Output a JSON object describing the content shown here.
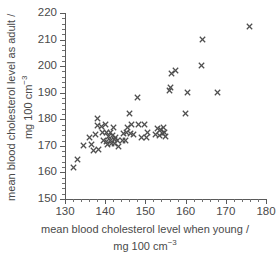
{
  "chart_data": {
    "type": "scatter",
    "title": "",
    "xlabel": "mean blood cholesterol level when young / mg 100 cm⁻³",
    "ylabel": "mean blood cholesterol level as adult / mg 100 cm⁻³",
    "xlabel_line1": "mean blood cholesterol level when young /",
    "xlabel_line2_prefix": "mg 100 cm",
    "xlabel_line2_sup": "−3",
    "ylabel_line1": "mean blood cholesterol level as adult /",
    "ylabel_line2_prefix": "mg 100 cm",
    "ylabel_line2_sup": "−3",
    "xlim": [
      130,
      180
    ],
    "ylim": [
      150,
      220
    ],
    "xticks": [
      130,
      140,
      150,
      160,
      170,
      180
    ],
    "yticks": [
      150,
      160,
      170,
      180,
      190,
      200,
      210,
      220
    ],
    "xtick_labels": [
      "130",
      "140",
      "150",
      "160",
      "170",
      "180"
    ],
    "ytick_labels": [
      "150",
      "160",
      "170",
      "180",
      "190",
      "200",
      "210",
      "220"
    ],
    "x_minor_step": 2,
    "y_minor_step": 2,
    "grid": false,
    "legend": false,
    "marker": "x",
    "marker_color": "#4f4f4f",
    "axis_color": "#5a5a5a",
    "background_color": "#ffffff",
    "points": [
      [
        132.0,
        162.0
      ],
      [
        133.2,
        165.0
      ],
      [
        134.6,
        170.3
      ],
      [
        136.2,
        173.0
      ],
      [
        136.6,
        170.5
      ],
      [
        137.0,
        168.2
      ],
      [
        137.6,
        174.2
      ],
      [
        138.0,
        180.3
      ],
      [
        138.2,
        177.8
      ],
      [
        138.4,
        168.5
      ],
      [
        139.0,
        177.2
      ],
      [
        139.4,
        175.2
      ],
      [
        139.6,
        172.0
      ],
      [
        140.0,
        178.0
      ],
      [
        140.2,
        175.0
      ],
      [
        140.4,
        171.6
      ],
      [
        140.6,
        170.6
      ],
      [
        140.8,
        173.4
      ],
      [
        141.2,
        175.0
      ],
      [
        141.4,
        172.2
      ],
      [
        141.6,
        170.8
      ],
      [
        141.8,
        174.0
      ],
      [
        142.0,
        176.8
      ],
      [
        142.2,
        172.4
      ],
      [
        142.4,
        170.9
      ],
      [
        142.6,
        173.2
      ],
      [
        143.0,
        172.0
      ],
      [
        143.4,
        169.6
      ],
      [
        144.2,
        172.2
      ],
      [
        144.6,
        174.6
      ],
      [
        145.0,
        172.2
      ],
      [
        145.2,
        175.2
      ],
      [
        145.6,
        177.0
      ],
      [
        146.0,
        182.2
      ],
      [
        146.2,
        174.6
      ],
      [
        146.6,
        178.0
      ],
      [
        147.0,
        174.2
      ],
      [
        148.0,
        188.2
      ],
      [
        148.4,
        178.2
      ],
      [
        149.0,
        173.2
      ],
      [
        149.8,
        178.2
      ],
      [
        150.2,
        173.0
      ],
      [
        150.6,
        175.2
      ],
      [
        152.6,
        174.4
      ],
      [
        153.0,
        176.6
      ],
      [
        153.4,
        173.8
      ],
      [
        153.8,
        176.2
      ],
      [
        154.2,
        174.8
      ],
      [
        154.4,
        177.0
      ],
      [
        154.8,
        175.0
      ],
      [
        155.0,
        173.6
      ],
      [
        156.0,
        191.0
      ],
      [
        156.2,
        192.0
      ],
      [
        156.4,
        197.4
      ],
      [
        157.6,
        198.4
      ],
      [
        160.0,
        182.2
      ],
      [
        160.4,
        190.2
      ],
      [
        164.0,
        200.2
      ],
      [
        164.2,
        210.2
      ],
      [
        168.0,
        190.2
      ],
      [
        176.0,
        215.0
      ]
    ]
  }
}
